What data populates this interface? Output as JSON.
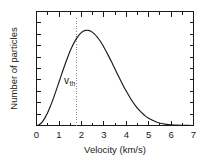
{
  "chart_data": {
    "type": "line",
    "title": "",
    "subtitle": "",
    "xlabel": "Velocity  (km/s)",
    "ylabel": "Number of particles",
    "xlim": [
      0,
      7
    ],
    "ylim": [
      0,
      1.06
    ],
    "grid": false,
    "legend": null,
    "legend_position": "none",
    "x_major_ticks": [
      0,
      1,
      2,
      3,
      4,
      5,
      6,
      7
    ],
    "x_major_tick_labels": [
      "0",
      "1",
      "2",
      "3",
      "4",
      "5",
      "6",
      "7"
    ],
    "x_minor_tick_step": 0.5,
    "y_tick_count": 11,
    "y_tick_labels": [],
    "frame": "box",
    "tick_direction": "in",
    "series": [
      {
        "name": "Maxwell-Boltzmann speed distribution",
        "color": "#1a1a1a",
        "x": [
          0.0,
          0.1,
          0.2,
          0.3,
          0.4,
          0.5,
          0.6,
          0.7,
          0.8,
          0.9,
          1.0,
          1.1,
          1.2,
          1.3,
          1.4,
          1.5,
          1.6,
          1.7,
          1.8,
          1.9,
          2.0,
          2.1,
          2.2,
          2.3,
          2.4,
          2.5,
          2.6,
          2.7,
          2.8,
          2.9,
          3.0,
          3.2,
          3.4,
          3.6,
          3.8,
          4.0,
          4.2,
          4.4,
          4.6,
          4.8,
          5.0,
          5.4,
          5.8,
          6.2,
          6.6,
          7.0
        ],
        "y": [
          0.0,
          0.005,
          0.021,
          0.046,
          0.08,
          0.121,
          0.169,
          0.222,
          0.28,
          0.34,
          0.402,
          0.464,
          0.525,
          0.584,
          0.64,
          0.692,
          0.739,
          0.78,
          0.815,
          0.843,
          0.864,
          0.878,
          0.885,
          0.885,
          0.879,
          0.866,
          0.848,
          0.825,
          0.797,
          0.765,
          0.73,
          0.652,
          0.568,
          0.482,
          0.398,
          0.32,
          0.249,
          0.188,
          0.138,
          0.098,
          0.067,
          0.028,
          0.01,
          0.003,
          0.001,
          0.0
        ]
      }
    ],
    "annotations": [
      {
        "name": "v-thermal-marker",
        "text_main": "v",
        "text_sub": "th",
        "x_value": 1.8,
        "label_x": 1.45,
        "label_y": 0.39,
        "marker_type": "vertical-dotted-line",
        "marker_color": "#8a8a8a",
        "marker_from_y": 0.0,
        "marker_to_y": 1.0
      }
    ]
  }
}
